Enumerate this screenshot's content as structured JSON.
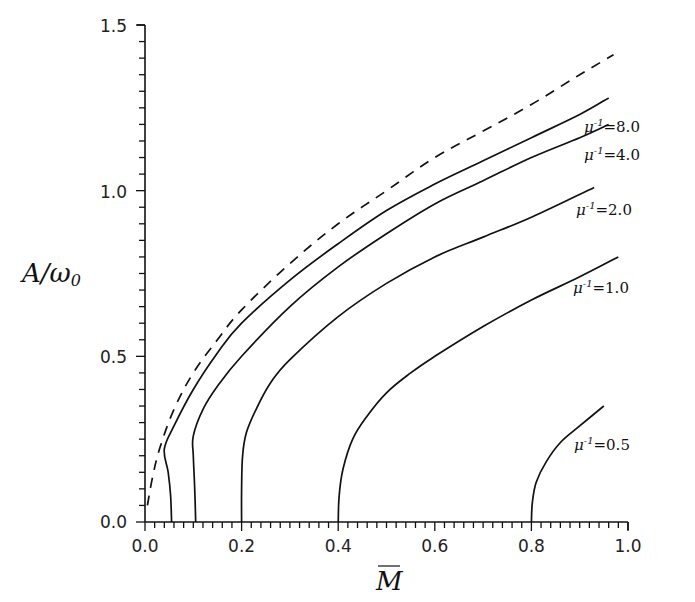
{
  "chart_data": {
    "type": "line",
    "title": "",
    "xlabel": "M̄",
    "ylabel": "A/ω₀",
    "xlim": [
      0.0,
      1.0
    ],
    "ylim": [
      0.0,
      1.5
    ],
    "grid": false,
    "legend": "inline labels at curve ends",
    "x_ticks": [
      "0.0",
      "0.2",
      "0.4",
      "0.6",
      "0.8",
      "1.0"
    ],
    "y_ticks": [
      "0.0",
      "0.5",
      "1.0",
      "1.5"
    ],
    "series": [
      {
        "name": "limit (dashed)",
        "style": "dashed",
        "label": "",
        "points": [
          [
            0.005,
            0.05
          ],
          [
            0.015,
            0.13
          ],
          [
            0.03,
            0.22
          ],
          [
            0.06,
            0.34
          ],
          [
            0.1,
            0.45
          ],
          [
            0.15,
            0.55
          ],
          [
            0.2,
            0.64
          ],
          [
            0.3,
            0.78
          ],
          [
            0.4,
            0.9
          ],
          [
            0.5,
            1.0
          ],
          [
            0.6,
            1.1
          ],
          [
            0.7,
            1.18
          ],
          [
            0.8,
            1.26
          ],
          [
            0.9,
            1.35
          ],
          [
            0.97,
            1.41
          ]
        ]
      },
      {
        "name": "mu^-1 = 8.0",
        "style": "solid",
        "label": "μ⁻¹=8.0",
        "points": [
          [
            0.055,
            0.0
          ],
          [
            0.053,
            0.08
          ],
          [
            0.048,
            0.15
          ],
          [
            0.04,
            0.22
          ],
          [
            0.06,
            0.29
          ],
          [
            0.1,
            0.4
          ],
          [
            0.15,
            0.51
          ],
          [
            0.2,
            0.6
          ],
          [
            0.3,
            0.73
          ],
          [
            0.4,
            0.84
          ],
          [
            0.5,
            0.94
          ],
          [
            0.6,
            1.02
          ],
          [
            0.7,
            1.09
          ],
          [
            0.8,
            1.16
          ],
          [
            0.9,
            1.23
          ],
          [
            0.96,
            1.28
          ]
        ]
      },
      {
        "name": "mu^-1 = 4.0",
        "style": "solid",
        "label": "μ⁻¹=4.0",
        "points": [
          [
            0.105,
            0.0
          ],
          [
            0.103,
            0.1
          ],
          [
            0.1,
            0.2
          ],
          [
            0.1,
            0.26
          ],
          [
            0.12,
            0.34
          ],
          [
            0.15,
            0.41
          ],
          [
            0.2,
            0.5
          ],
          [
            0.3,
            0.65
          ],
          [
            0.4,
            0.77
          ],
          [
            0.5,
            0.87
          ],
          [
            0.6,
            0.96
          ],
          [
            0.7,
            1.03
          ],
          [
            0.8,
            1.1
          ],
          [
            0.9,
            1.16
          ],
          [
            0.96,
            1.2
          ]
        ]
      },
      {
        "name": "mu^-1 = 2.0",
        "style": "solid",
        "label": "μ⁻¹=2.0",
        "points": [
          [
            0.2,
            0.0
          ],
          [
            0.2,
            0.1
          ],
          [
            0.202,
            0.2
          ],
          [
            0.21,
            0.27
          ],
          [
            0.23,
            0.34
          ],
          [
            0.26,
            0.42
          ],
          [
            0.3,
            0.49
          ],
          [
            0.4,
            0.62
          ],
          [
            0.5,
            0.72
          ],
          [
            0.6,
            0.8
          ],
          [
            0.7,
            0.86
          ],
          [
            0.8,
            0.92
          ],
          [
            0.93,
            1.01
          ]
        ]
      },
      {
        "name": "mu^-1 = 1.0",
        "style": "solid",
        "label": "μ⁻¹=1.0",
        "points": [
          [
            0.4,
            0.0
          ],
          [
            0.402,
            0.08
          ],
          [
            0.41,
            0.16
          ],
          [
            0.43,
            0.25
          ],
          [
            0.46,
            0.32
          ],
          [
            0.5,
            0.39
          ],
          [
            0.55,
            0.45
          ],
          [
            0.6,
            0.5
          ],
          [
            0.7,
            0.59
          ],
          [
            0.8,
            0.67
          ],
          [
            0.9,
            0.74
          ],
          [
            0.98,
            0.8
          ]
        ]
      },
      {
        "name": "mu^-1 = 0.5",
        "style": "solid",
        "label": "μ⁻¹=0.5",
        "points": [
          [
            0.8,
            0.0
          ],
          [
            0.802,
            0.06
          ],
          [
            0.81,
            0.12
          ],
          [
            0.83,
            0.18
          ],
          [
            0.86,
            0.24
          ],
          [
            0.9,
            0.29
          ],
          [
            0.95,
            0.35
          ]
        ]
      }
    ],
    "annotations": [
      {
        "text": "μ⁻¹=8.0",
        "at": [
          0.91,
          1.25
        ]
      },
      {
        "text": "μ⁻¹=4.0",
        "at": [
          0.91,
          1.17
        ]
      },
      {
        "text": "μ⁻¹=2.0",
        "at": [
          0.86,
          0.91
        ]
      },
      {
        "text": "μ⁻¹=1.0",
        "at": [
          0.85,
          0.68
        ]
      },
      {
        "text": "μ⁻¹=0.5",
        "at": [
          0.83,
          0.25
        ]
      }
    ]
  },
  "axes": {
    "x_title_main": "M",
    "y_title_main": "A/ω",
    "y_title_sub": "0"
  },
  "labels": {
    "mu8_base": "μ",
    "mu_exp": "-1",
    "mu8_val": "=8.0",
    "mu4_val": "=4.0",
    "mu2_val": "=2.0",
    "mu1_val": "=1.0",
    "mu05_val": "=0.5"
  },
  "ticks": {
    "x": [
      "0.0",
      "0.2",
      "0.4",
      "0.6",
      "0.8",
      "1.0"
    ],
    "y": [
      "0.0",
      "0.5",
      "1.0",
      "1.5"
    ]
  }
}
